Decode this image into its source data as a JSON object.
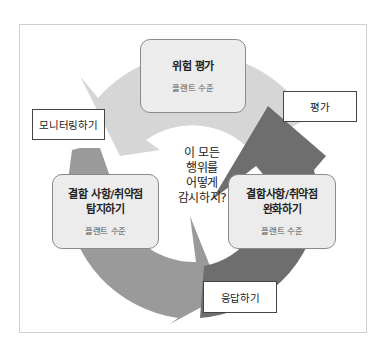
{
  "diagram": {
    "type": "cycle",
    "center_question": {
      "lines": [
        "이 모든",
        "행위를",
        "어떻게",
        "감시하지?"
      ]
    },
    "stages": {
      "risk_assessment": {
        "title_lines": [
          "위험 평가"
        ],
        "subtitle": "플랜트 수준"
      },
      "detect": {
        "title_lines": [
          "결함 사항/취약점",
          "탐지하기"
        ],
        "subtitle": "플랜트 수준"
      },
      "mitigate": {
        "title_lines": [
          "결함사항/취약점",
          "완화하기"
        ],
        "subtitle": "플랜트 수준"
      }
    },
    "actions": {
      "monitor": "모니터링하기",
      "assess": "평가",
      "respond": "응답하기"
    },
    "colors": {
      "frame_border": "#cfcfcf",
      "box_fill": "#ececec",
      "box_border": "#8a8a8a",
      "arrow_light": "#d6d6d6",
      "arrow_medium": "#9a9a9a",
      "arrow_dark": "#6e6e6e",
      "label_border": "#444444"
    }
  }
}
